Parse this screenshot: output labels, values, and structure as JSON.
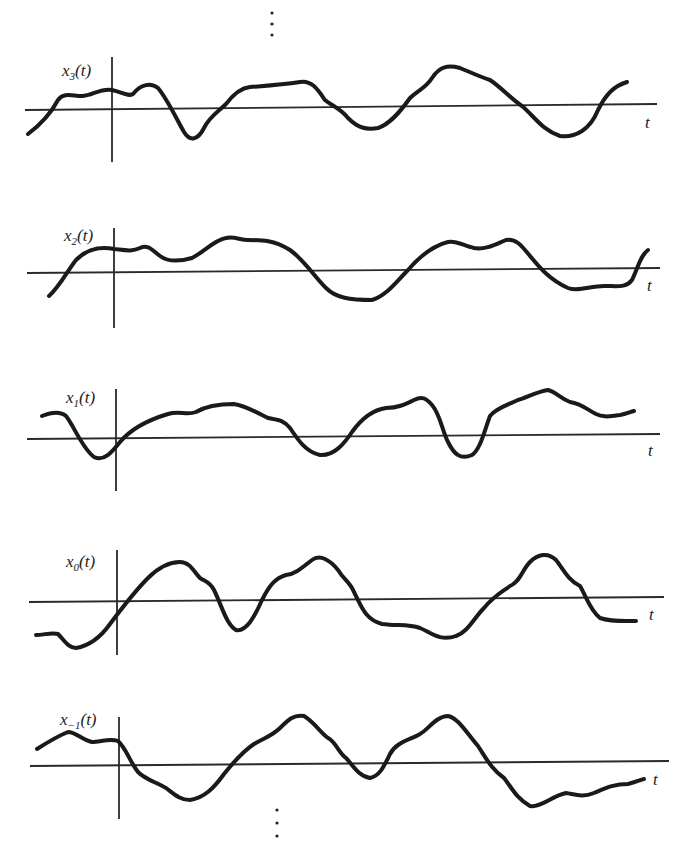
{
  "figure": {
    "ellipsis_top": "⋮",
    "ellipsis_bottom": "⋮",
    "time_axis_label": "t",
    "panels": [
      {
        "name": "x3",
        "label_main": "x",
        "label_sub": "3",
        "label_arg": "(t)"
      },
      {
        "name": "x2",
        "label_main": "x",
        "label_sub": "2",
        "label_arg": "(t)"
      },
      {
        "name": "x1",
        "label_main": "x",
        "label_sub": "1",
        "label_arg": "(t)"
      },
      {
        "name": "x0",
        "label_main": "x",
        "label_sub": "0",
        "label_arg": "(t)"
      },
      {
        "name": "x-1",
        "label_main": "x",
        "label_sub": "−1",
        "label_arg": "(t)"
      }
    ]
  },
  "colors": {
    "ink": "#1a1a1a",
    "background": "#ffffff"
  }
}
